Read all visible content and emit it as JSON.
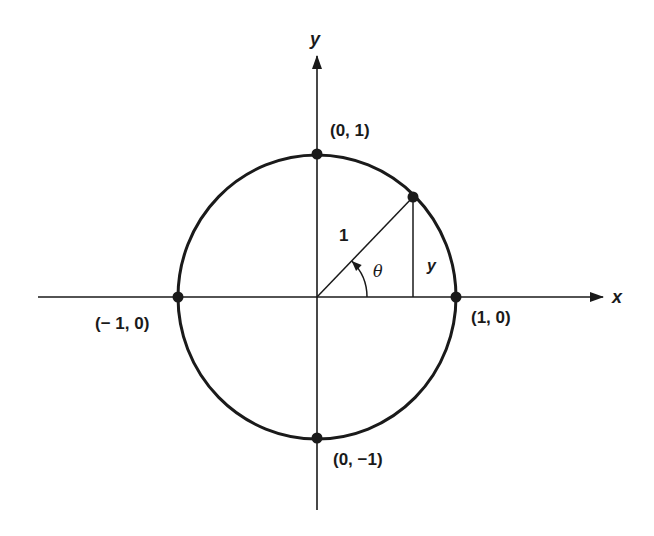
{
  "diagram": {
    "axes": {
      "x_label": "x",
      "y_label": "y"
    },
    "circle": {
      "radius_value": 1
    },
    "points": [
      {
        "id": "top",
        "coords": [
          0,
          1
        ],
        "label": "(0, 1)"
      },
      {
        "id": "bottom",
        "coords": [
          0,
          -1
        ],
        "label": "(0, −1)"
      },
      {
        "id": "left",
        "coords": [
          -1,
          0
        ],
        "label": "(− 1, 0)"
      },
      {
        "id": "right",
        "coords": [
          1,
          0
        ],
        "label": "(1, 0)"
      }
    ],
    "radius_line": {
      "label": "1",
      "angle_label": "θ",
      "angle_degrees": 46,
      "opposite_side_label": "y"
    },
    "colors": {
      "ink": "#1a1a1a",
      "background": "#ffffff"
    }
  }
}
